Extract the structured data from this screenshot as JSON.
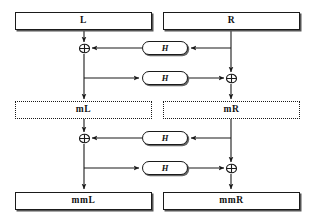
{
  "diagram": {
    "type": "block-diagram",
    "colors": {
      "line": "#1a1a1a",
      "background": "#ffffff",
      "shadow": "#555555"
    },
    "registers": [
      {
        "id": "L",
        "label": "L",
        "style": "solid",
        "x": 15,
        "y": 12,
        "w": 137,
        "h": 18
      },
      {
        "id": "R",
        "label": "R",
        "style": "solid",
        "x": 163,
        "y": 12,
        "w": 137,
        "h": 18
      },
      {
        "id": "mL",
        "label": "mL",
        "style": "dotted",
        "x": 15,
        "y": 101,
        "w": 137,
        "h": 18
      },
      {
        "id": "mR",
        "label": "mR",
        "style": "dotted",
        "x": 163,
        "y": 101,
        "w": 137,
        "h": 18
      },
      {
        "id": "mmL",
        "label": "mmL",
        "style": "solid",
        "x": 15,
        "y": 192,
        "w": 137,
        "h": 18
      },
      {
        "id": "mmR",
        "label": "mmR",
        "style": "solid",
        "x": 163,
        "y": 192,
        "w": 137,
        "h": 18
      }
    ],
    "functions": [
      {
        "id": "h1",
        "label": "H",
        "x": 142,
        "y": 41,
        "w": 46,
        "h": 14
      },
      {
        "id": "h2",
        "label": "H",
        "x": 142,
        "y": 71,
        "w": 46,
        "h": 14
      },
      {
        "id": "h3",
        "label": "H",
        "x": 142,
        "y": 131,
        "w": 46,
        "h": 14
      },
      {
        "id": "h4",
        "label": "H",
        "x": 142,
        "y": 161,
        "w": 46,
        "h": 14
      }
    ],
    "xor_gates": [
      {
        "id": "x1",
        "label": "xor",
        "cx": 84,
        "cy": 48
      },
      {
        "id": "x2",
        "label": "xor",
        "cx": 231,
        "cy": 78
      },
      {
        "id": "x3",
        "label": "xor",
        "cx": 84,
        "cy": 138
      },
      {
        "id": "x4",
        "label": "xor",
        "cx": 231,
        "cy": 168
      }
    ],
    "rails": {
      "left_x": 84,
      "right_x": 231
    },
    "stages": [
      {
        "name": "stage-1",
        "from": [
          "L",
          "R"
        ],
        "to": [
          "mL",
          "mR"
        ],
        "rounds": [
          "R -> H -> xor with L",
          "L -> H -> xor with R"
        ]
      },
      {
        "name": "stage-2",
        "from": [
          "mL",
          "mR"
        ],
        "to": [
          "mmL",
          "mmR"
        ],
        "rounds": [
          "mR -> H -> xor with mL",
          "mL -> H -> xor with mR"
        ]
      }
    ]
  }
}
